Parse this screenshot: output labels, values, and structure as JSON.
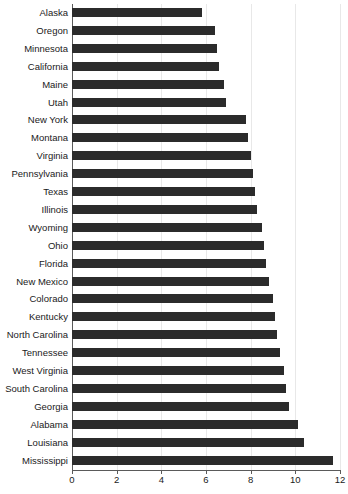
{
  "chart_data": {
    "type": "bar",
    "orientation": "horizontal",
    "title": "",
    "subtitle": "",
    "xlabel": "",
    "ylabel": "",
    "xlim": [
      0,
      12
    ],
    "xticks": [
      0,
      2,
      4,
      6,
      8,
      10,
      12
    ],
    "xtick_labels": [
      "0",
      "2",
      "4",
      "6",
      "8",
      "10",
      "12"
    ],
    "grid": true,
    "grid_axis": "x",
    "legend": false,
    "legend_position": "none",
    "bar_color": "#2b2b2b",
    "categories": [
      "Alaska",
      "Oregon",
      "Minnesota",
      "California",
      "Maine",
      "Utah",
      "New York",
      "Montana",
      "Virginia",
      "Pennsylvania",
      "Texas",
      "Illinois",
      "Wyoming",
      "Ohio",
      "Florida",
      "New Mexico",
      "Colorado",
      "Kentucky",
      "North Carolina",
      "Tennessee",
      "West Virginia",
      "South Carolina",
      "Georgia",
      "Alabama",
      "Louisiana",
      "Mississippi"
    ],
    "values": [
      5.8,
      6.4,
      6.5,
      6.6,
      6.8,
      6.9,
      7.8,
      7.9,
      8.0,
      8.1,
      8.2,
      8.3,
      8.5,
      8.6,
      8.7,
      8.8,
      9.0,
      9.1,
      9.2,
      9.3,
      9.5,
      9.6,
      9.7,
      10.1,
      10.4,
      11.7
    ]
  }
}
